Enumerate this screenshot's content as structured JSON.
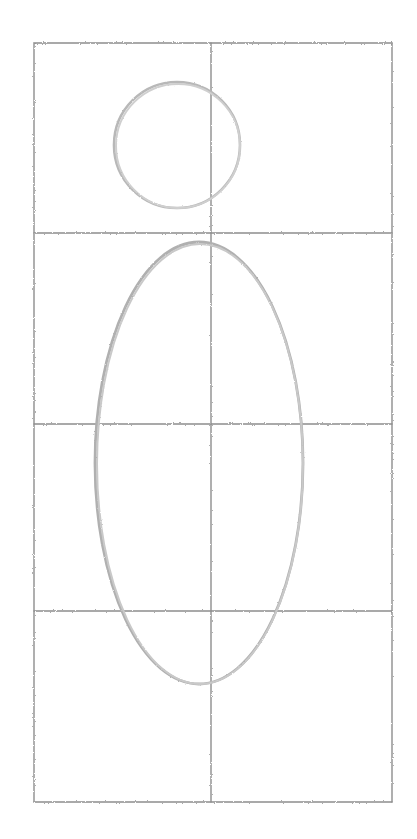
{
  "document": {
    "kind": "pencil-sketch",
    "medium": "graphite pencil on white paper",
    "subject": "figure construction study: head circle and body ellipse over a rectangular guide grid",
    "canvas": {
      "width": 417,
      "height": 839,
      "background": "#ffffff"
    }
  },
  "palette": {
    "paper": "#ffffff",
    "grid_stroke": "#8d8d8d",
    "grid_stroke_light": "#a0a0a0",
    "shape_stroke": "#b4b4b4",
    "shape_stroke_light": "#c8c8c8"
  },
  "grid": {
    "label": "construction-grid",
    "left": 34,
    "right": 392,
    "top": 43,
    "bottom": 802,
    "stroke_width": 1.4,
    "vertical_lines": [
      {
        "name": "grid-line-left-border",
        "x": 34
      },
      {
        "name": "grid-line-vertical-center",
        "x": 211
      },
      {
        "name": "grid-line-right-border",
        "x": 392
      }
    ],
    "horizontal_lines": [
      {
        "name": "grid-line-top-border",
        "y": 43
      },
      {
        "name": "grid-line-horizontal-1",
        "y": 233
      },
      {
        "name": "grid-line-horizontal-2",
        "y": 424
      },
      {
        "name": "grid-line-horizontal-3",
        "y": 611
      },
      {
        "name": "grid-line-bottom-border",
        "y": 802
      }
    ],
    "cells": {
      "columns": 2,
      "rows": 4
    }
  },
  "shapes": [
    {
      "name": "head-circle",
      "type": "circle",
      "cx": 177,
      "cy": 145,
      "r": 63,
      "stroke": "#b8b8b8",
      "stroke_width": 2.6,
      "note": "head outline, straddles the vertical center grid line, sits in the top-left grid cell"
    },
    {
      "name": "body-ellipse",
      "type": "ellipse",
      "cx": 199,
      "cy": 463,
      "rx": 104,
      "ry": 221,
      "stroke": "#b0b0b0",
      "stroke_width": 2.8,
      "note": "large vertical torso ellipse spanning from just under the first horizontal line to below the third"
    }
  ]
}
